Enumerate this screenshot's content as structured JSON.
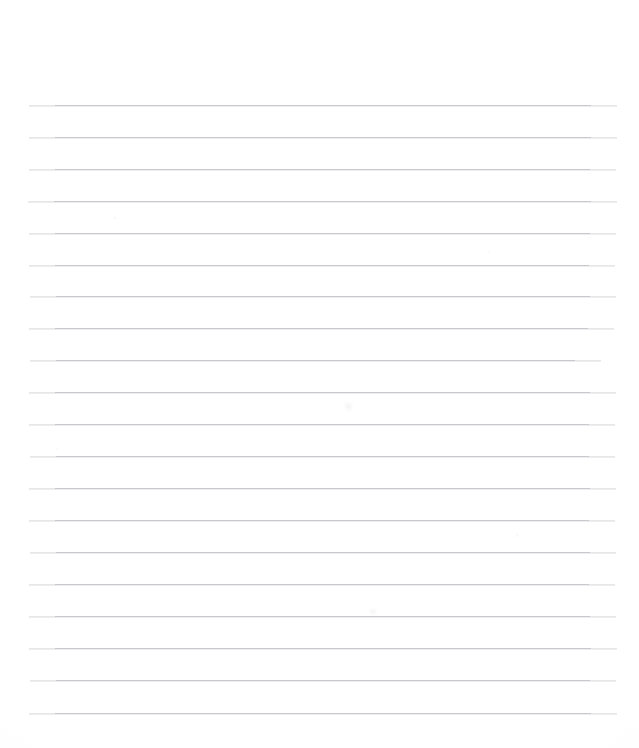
{
  "document": {
    "kind": "ruled-notebook-paper-scan",
    "title": "Blank Ruled Paper",
    "content_text": "",
    "is_blank": true,
    "page_width": 639,
    "page_height": 748,
    "page_color": "#ffffff"
  },
  "ruling": {
    "line_color": "#c9c9cd",
    "line_thickness_px": 1,
    "line_count": 20,
    "line_spacing_px": 32,
    "first_line_y": 105,
    "last_line_y": 713,
    "left_margin_x": 28,
    "right_margin_x": 617,
    "top_blank_space_px": 105,
    "bottom_blank_space_px": 35,
    "has_vertical_margin_rule": false,
    "has_holes": false,
    "lines": [
      {
        "index": 1,
        "y": 105,
        "x_start": 29,
        "x_end": 617
      },
      {
        "index": 2,
        "y": 137,
        "x_start": 29,
        "x_end": 617
      },
      {
        "index": 3,
        "y": 169,
        "x_start": 29,
        "x_end": 616
      },
      {
        "index": 4,
        "y": 201,
        "x_start": 28,
        "x_end": 617
      },
      {
        "index": 5,
        "y": 233,
        "x_start": 29,
        "x_end": 616
      },
      {
        "index": 6,
        "y": 265,
        "x_start": 29,
        "x_end": 615
      },
      {
        "index": 7,
        "y": 296,
        "x_start": 30,
        "x_end": 616
      },
      {
        "index": 8,
        "y": 328,
        "x_start": 29,
        "x_end": 614
      },
      {
        "index": 9,
        "y": 360,
        "x_start": 30,
        "x_end": 601
      },
      {
        "index": 10,
        "y": 392,
        "x_start": 29,
        "x_end": 616
      },
      {
        "index": 11,
        "y": 424,
        "x_start": 29,
        "x_end": 615
      },
      {
        "index": 12,
        "y": 456,
        "x_start": 30,
        "x_end": 615
      },
      {
        "index": 13,
        "y": 488,
        "x_start": 29,
        "x_end": 616
      },
      {
        "index": 14,
        "y": 520,
        "x_start": 29,
        "x_end": 615
      },
      {
        "index": 15,
        "y": 552,
        "x_start": 30,
        "x_end": 616
      },
      {
        "index": 16,
        "y": 584,
        "x_start": 29,
        "x_end": 615
      },
      {
        "index": 17,
        "y": 616,
        "x_start": 29,
        "x_end": 616
      },
      {
        "index": 18,
        "y": 648,
        "x_start": 29,
        "x_end": 617
      },
      {
        "index": 19,
        "y": 680,
        "x_start": 30,
        "x_end": 616
      },
      {
        "index": 20,
        "y": 713,
        "x_start": 29,
        "x_end": 617
      }
    ]
  },
  "artifacts": [
    {
      "name": "smudge-upper-mid",
      "x": 344,
      "y": 400,
      "w": 9,
      "h": 13,
      "opacity": 0.35
    },
    {
      "name": "smudge-lower-mid",
      "x": 369,
      "y": 606,
      "w": 8,
      "h": 11,
      "opacity": 0.3
    },
    {
      "name": "speck-left-upper",
      "x": 113,
      "y": 216,
      "w": 4,
      "h": 4,
      "opacity": 0.28
    },
    {
      "name": "speck-right-mid",
      "x": 487,
      "y": 250,
      "w": 4,
      "h": 4,
      "opacity": 0.22
    },
    {
      "name": "speck-right-lower",
      "x": 515,
      "y": 533,
      "w": 5,
      "h": 5,
      "opacity": 0.24
    },
    {
      "name": "speck-left-low",
      "x": 55,
      "y": 447,
      "w": 4,
      "h": 4,
      "opacity": 0.2
    }
  ]
}
